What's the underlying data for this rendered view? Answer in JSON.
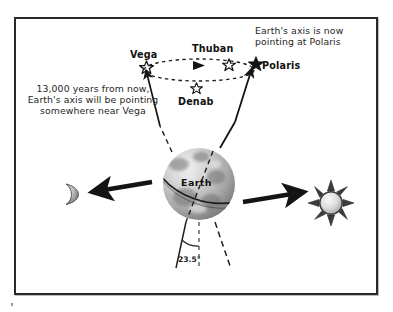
{
  "figure": {
    "annotations": {
      "polaris_note": "Earth's axis is now\npointing at Polaris",
      "vega_note": "13,000 years from now,\nEarth's axis will be pointing\nsomewhere near Vega"
    },
    "stars": [
      {
        "name": "Vega",
        "marker": "hollow-star"
      },
      {
        "name": "Thuban",
        "marker": "hollow-star"
      },
      {
        "name": "Polaris",
        "marker": "filled-star"
      },
      {
        "name": "Denab",
        "marker": "hollow-star"
      }
    ],
    "body_labels": {
      "earth": "Earth"
    },
    "measurements": {
      "axial_tilt": "23.5°"
    },
    "icons": {
      "moon": "crescent-moon-icon",
      "sun": "sun-icon",
      "precession_arrow": "precession-direction-arrowhead"
    },
    "colors": {
      "ink": "#1b1b1b",
      "frame": "#2a2a2a",
      "arrow": "#141414",
      "globe_dark": "#4a4a4a",
      "globe_light": "#f2f2f2"
    }
  }
}
